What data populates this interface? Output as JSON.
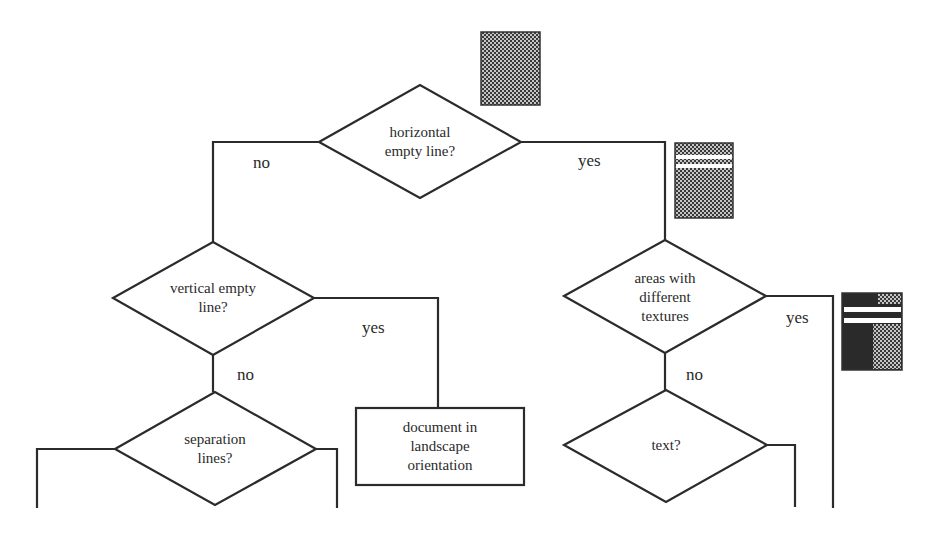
{
  "diagram": {
    "type": "flowchart",
    "nodes": {
      "horizontal": {
        "shape": "diamond",
        "lines": [
          "horizontal",
          "empty line?"
        ]
      },
      "vertical": {
        "shape": "diamond",
        "lines": [
          "vertical empty",
          "line?"
        ]
      },
      "separation": {
        "shape": "diamond",
        "lines": [
          "separation",
          "lines?"
        ]
      },
      "landscape": {
        "shape": "rectangle",
        "lines": [
          "document in",
          "landscape",
          "orientation"
        ]
      },
      "textures": {
        "shape": "diamond",
        "lines": [
          "areas with",
          "different",
          "textures"
        ]
      },
      "text": {
        "shape": "diamond",
        "lines": [
          "text?"
        ]
      }
    },
    "edge_labels": {
      "horizontal_no": "no",
      "horizontal_yes": "yes",
      "vertical_yes": "yes",
      "vertical_no": "no",
      "textures_yes": "yes",
      "textures_no": "no"
    },
    "thumbnails": [
      {
        "name": "full-texture-page",
        "description": "uniform dotted texture block"
      },
      {
        "name": "page-with-horizontal-gaps",
        "description": "dotted block split by two white horizontal lines"
      },
      {
        "name": "page-with-mixed-textures",
        "description": "dark and dotted regions split by white horizontal lines"
      }
    ],
    "colors": {
      "line": "#2b2b2b",
      "texture_dark": "#3a3a3a",
      "texture_dot": "#bdbdbd",
      "background": "#ffffff"
    }
  }
}
